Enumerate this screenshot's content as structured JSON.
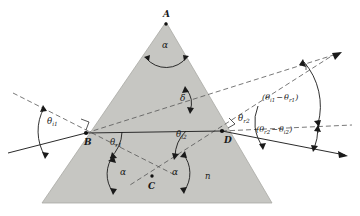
{
  "figure": {
    "kind": "optics-ray-diagram",
    "background_color": "#ffffff",
    "prism": {
      "fill_color": "#c6c6c2",
      "stroke_color": "#9a9a96",
      "apex_label": "A",
      "entry_point_label": "B",
      "crossing_point_label": "C",
      "exit_point_label": "D",
      "index_label": "n"
    },
    "angles": {
      "apex": "α",
      "base_left": "α",
      "base_right": "α",
      "deviation": "δ"
    },
    "theta": {
      "incidence_1_base": "θ",
      "incidence_1_sub": "i1",
      "refraction_1_base": "θ",
      "refraction_1_sub": "r1",
      "incidence_2_base": "θ",
      "incidence_2_sub": "i2",
      "refraction_2_base": "θ",
      "refraction_2_sub": "r2"
    },
    "expressions": {
      "upper_open": "(",
      "upper_first_base": "θ",
      "upper_first_sub": "i1",
      "upper_minus": "−",
      "upper_second_base": "θ",
      "upper_second_sub": "r1",
      "upper_close": ")",
      "lower_open": "(",
      "lower_first_base": "θ",
      "lower_first_sub": "r2",
      "lower_minus": "−",
      "lower_second_base": "θ",
      "lower_second_sub": "i2",
      "lower_close": ")"
    },
    "line_styles": {
      "ray_color": "#2b2b2b",
      "normal_color": "#4a4a4a",
      "arc_color": "#1a1a1a",
      "normal_dash": "5,3"
    }
  }
}
